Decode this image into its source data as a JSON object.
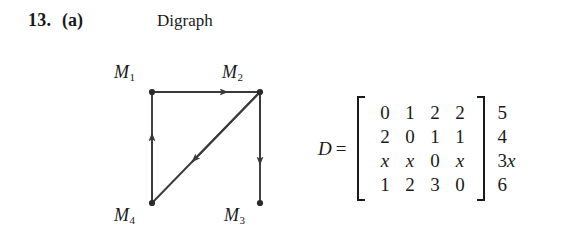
{
  "exercise": {
    "number": "13.",
    "part": "(a)"
  },
  "figure": {
    "caption": "Digraph",
    "nodes": [
      {
        "id": "m1",
        "label": "M",
        "subscript": "1",
        "x": 52,
        "y": 37
      },
      {
        "id": "m2",
        "label": "M",
        "subscript": "2",
        "x": 160,
        "y": 37
      },
      {
        "id": "m3",
        "label": "M",
        "subscript": "3",
        "x": 161,
        "y": 148
      },
      {
        "id": "m4",
        "label": "M",
        "subscript": "4",
        "x": 52,
        "y": 148
      }
    ],
    "edges": [
      {
        "from": "m1",
        "to": "m2",
        "direction": "right"
      },
      {
        "from": "m2",
        "to": "m3",
        "direction": "down"
      },
      {
        "from": "m2",
        "to": "m4",
        "direction": "diagonal-down-left"
      },
      {
        "from": "m4",
        "to": "m1",
        "direction": "up"
      }
    ],
    "stroke_color": "#3a3a3a"
  },
  "matrix": {
    "name": "D",
    "equals": "=",
    "rows": [
      [
        "0",
        "1",
        "2",
        "2"
      ],
      [
        "2",
        "0",
        "1",
        "1"
      ],
      [
        "x",
        "x",
        "0",
        "x"
      ],
      [
        "1",
        "2",
        "3",
        "0"
      ]
    ],
    "italic_cells": [
      "x"
    ],
    "row_annotations": [
      {
        "text": "5",
        "italic_tail": ""
      },
      {
        "text": "4",
        "italic_tail": ""
      },
      {
        "text": "3",
        "italic_tail": "x"
      },
      {
        "text": "6",
        "italic_tail": ""
      }
    ]
  }
}
